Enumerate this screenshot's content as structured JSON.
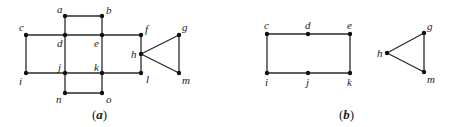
{
  "diagram_a": {
    "caption": "(a)",
    "caption_inner": "a",
    "nodes": {
      "a": {
        "label": "a",
        "x": 65,
        "y": 16
      },
      "b": {
        "label": "b",
        "x": 102,
        "y": 16
      },
      "c": {
        "label": "c",
        "x": 26,
        "y": 35
      },
      "d": {
        "label": "d",
        "x": 65,
        "y": 35
      },
      "e": {
        "label": "e",
        "x": 102,
        "y": 35
      },
      "f": {
        "label": "f",
        "x": 141,
        "y": 35
      },
      "g": {
        "label": "g",
        "x": 179,
        "y": 35
      },
      "h": {
        "label": "h",
        "x": 141,
        "y": 54
      },
      "i": {
        "label": "i",
        "x": 26,
        "y": 73
      },
      "j": {
        "label": "j",
        "x": 65,
        "y": 73
      },
      "k": {
        "label": "k",
        "x": 102,
        "y": 73
      },
      "l": {
        "label": "l",
        "x": 141,
        "y": 73
      },
      "m": {
        "label": "m",
        "x": 179,
        "y": 73
      },
      "n": {
        "label": "n",
        "x": 65,
        "y": 93
      },
      "o": {
        "label": "o",
        "x": 102,
        "y": 93
      }
    },
    "edges": [
      [
        "a",
        "b"
      ],
      [
        "a",
        "d"
      ],
      [
        "b",
        "e"
      ],
      [
        "c",
        "d"
      ],
      [
        "d",
        "e"
      ],
      [
        "e",
        "f"
      ],
      [
        "c",
        "i"
      ],
      [
        "d",
        "j"
      ],
      [
        "e",
        "k"
      ],
      [
        "f",
        "h"
      ],
      [
        "h",
        "l"
      ],
      [
        "i",
        "j"
      ],
      [
        "j",
        "k"
      ],
      [
        "k",
        "l"
      ],
      [
        "j",
        "n"
      ],
      [
        "k",
        "o"
      ],
      [
        "n",
        "o"
      ],
      [
        "h",
        "g"
      ],
      [
        "g",
        "m"
      ],
      [
        "h",
        "m"
      ]
    ]
  },
  "diagram_b": {
    "caption": "(b)",
    "caption_inner": "b",
    "nodes": {
      "c": {
        "label": "c",
        "x": 267,
        "y": 34
      },
      "d": {
        "label": "d",
        "x": 308,
        "y": 34
      },
      "e": {
        "label": "e",
        "x": 350,
        "y": 34
      },
      "i": {
        "label": "i",
        "x": 267,
        "y": 73
      },
      "j": {
        "label": "j",
        "x": 308,
        "y": 73
      },
      "k": {
        "label": "k",
        "x": 350,
        "y": 73
      },
      "g": {
        "label": "g",
        "x": 424,
        "y": 33
      },
      "h": {
        "label": "h",
        "x": 387,
        "y": 53
      },
      "m": {
        "label": "m",
        "x": 424,
        "y": 72
      }
    },
    "edges": [
      [
        "c",
        "d"
      ],
      [
        "d",
        "e"
      ],
      [
        "e",
        "k"
      ],
      [
        "k",
        "j"
      ],
      [
        "j",
        "i"
      ],
      [
        "i",
        "c"
      ],
      [
        "h",
        "g"
      ],
      [
        "g",
        "m"
      ],
      [
        "h",
        "m"
      ]
    ]
  }
}
